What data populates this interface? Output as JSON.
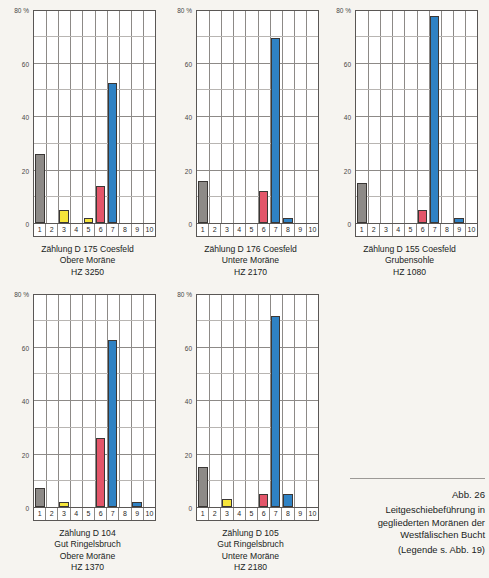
{
  "figure": {
    "number_label": "Abb. 26",
    "title_lines": [
      "Leitgeschiebeführung in",
      "gegliederten Moränen der",
      "Westfälischen Bucht"
    ],
    "legend_note": "(Legende s. Abb. 19)"
  },
  "axis": {
    "y_ticks": [
      "80 %",
      "60",
      "40",
      "20",
      "0"
    ],
    "y_values": [
      80,
      60,
      40,
      20,
      0
    ],
    "y_minor_values": [
      70,
      50,
      30,
      10
    ],
    "x_ticks": [
      "1",
      "2",
      "3",
      "4",
      "5",
      "6",
      "7",
      "8",
      "9",
      "10"
    ],
    "ylim": [
      0,
      80
    ]
  },
  "colors": {
    "gray": "#8d8a87",
    "yellow": "#f6e53a",
    "red": "#e3566a",
    "blue": "#2f82c4",
    "frame": "#5a5755",
    "grid": "#8d8a87",
    "paper": "#f6f4f0"
  },
  "chart_data": [
    {
      "type": "bar",
      "id": "d175",
      "title": "Zählung D 175 Coesfeld",
      "caption_lines": [
        "Zählung D 175 Coesfeld",
        "Obere Moräne",
        "HZ 3250"
      ],
      "xlabel": "",
      "ylabel": "80 %",
      "ylim": [
        0,
        80
      ],
      "categories": [
        "1",
        "2",
        "3",
        "4",
        "5",
        "6",
        "7",
        "8",
        "9",
        "10"
      ],
      "values": [
        26,
        0,
        5,
        0,
        2,
        14,
        53,
        0,
        0,
        0
      ],
      "bar_colors": [
        "gray",
        "none",
        "yellow",
        "none",
        "yellow",
        "red",
        "blue",
        "none",
        "none",
        "none"
      ]
    },
    {
      "type": "bar",
      "id": "d176",
      "title": "Zählung D 176 Coesfeld",
      "caption_lines": [
        "Zählung D 176 Coesfeld",
        "Untere Moräne",
        "HZ 2170"
      ],
      "xlabel": "",
      "ylabel": "80 %",
      "ylim": [
        0,
        80
      ],
      "categories": [
        "1",
        "2",
        "3",
        "4",
        "5",
        "6",
        "7",
        "8",
        "9",
        "10"
      ],
      "values": [
        16,
        0,
        0,
        0,
        0,
        12,
        70,
        2,
        0,
        0
      ],
      "bar_colors": [
        "gray",
        "none",
        "none",
        "none",
        "none",
        "red",
        "blue",
        "blue",
        "none",
        "none"
      ]
    },
    {
      "type": "bar",
      "id": "d155",
      "title": "Zählung D 155 Coesfeld",
      "caption_lines": [
        "Zählung D 155 Coesfeld",
        "Grubensohle",
        "HZ 1080"
      ],
      "xlabel": "",
      "ylabel": "80 %",
      "ylim": [
        0,
        80
      ],
      "categories": [
        "1",
        "2",
        "3",
        "4",
        "5",
        "6",
        "7",
        "8",
        "9",
        "10"
      ],
      "values": [
        15,
        0,
        0,
        0,
        0,
        5,
        78,
        0,
        2,
        0
      ],
      "bar_colors": [
        "gray",
        "none",
        "none",
        "none",
        "none",
        "red",
        "blue",
        "none",
        "blue",
        "none"
      ]
    },
    {
      "type": "bar",
      "id": "d104",
      "title": "Zählung D 104",
      "caption_lines": [
        "Zählung D 104",
        "Gut Ringelsbruch",
        "Obere Moräne",
        "HZ 1370"
      ],
      "xlabel": "",
      "ylabel": "80 %",
      "ylim": [
        0,
        80
      ],
      "categories": [
        "1",
        "2",
        "3",
        "4",
        "5",
        "6",
        "7",
        "8",
        "9",
        "10"
      ],
      "values": [
        7,
        0,
        2,
        0,
        0,
        26,
        63,
        0,
        2,
        0
      ],
      "bar_colors": [
        "gray",
        "none",
        "yellow",
        "none",
        "none",
        "red",
        "blue",
        "none",
        "blue",
        "none"
      ]
    },
    {
      "type": "bar",
      "id": "d105",
      "title": "Zählung D 105",
      "caption_lines": [
        "Zählung D 105",
        "Gut Ringelsbruch",
        "Untere Moräne",
        "HZ 2180"
      ],
      "xlabel": "",
      "ylabel": "80 %",
      "ylim": [
        0,
        80
      ],
      "categories": [
        "1",
        "2",
        "3",
        "4",
        "5",
        "6",
        "7",
        "8",
        "9",
        "10"
      ],
      "values": [
        15,
        0,
        3,
        0,
        0,
        5,
        72,
        5,
        0,
        0
      ],
      "bar_colors": [
        "gray",
        "none",
        "yellow",
        "none",
        "none",
        "red",
        "blue",
        "blue",
        "none",
        "none"
      ]
    }
  ]
}
